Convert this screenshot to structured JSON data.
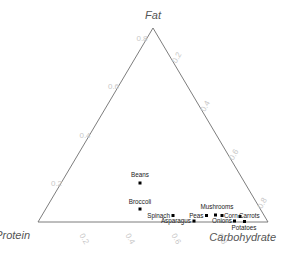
{
  "chart_data": {
    "type": "scatter",
    "subtype": "ternary",
    "title": "",
    "axes": {
      "top": {
        "name": "Fat",
        "label": "Fat"
      },
      "left": {
        "name": "Protein",
        "label": "Protein"
      },
      "right": {
        "name": "Carbohydrate",
        "label": "Carbohydrate"
      }
    },
    "ticks": {
      "left": [
        "0.2",
        "0.4",
        "0.6",
        "0.8"
      ],
      "right": [
        "0.2",
        "0.4",
        "0.6",
        "0.8"
      ],
      "bottom": [
        "0.2",
        "0.4",
        "0.6",
        "0.8"
      ]
    },
    "axis_range": [
      0,
      1
    ],
    "grid": false,
    "legend": "none",
    "points": [
      {
        "label": "Beans",
        "px": 140.0,
        "py": 183.0,
        "lx": 140.0,
        "ly": 177.0,
        "anchor": "middle"
      },
      {
        "label": "Broccoli",
        "px": 140.0,
        "py": 209.0,
        "lx": 140.0,
        "ly": 203.5,
        "anchor": "middle"
      },
      {
        "label": "Spinach",
        "px": 173.0,
        "py": 215.5,
        "lx": 170.0,
        "ly": 217.5,
        "anchor": "end"
      },
      {
        "label": "Asparagus",
        "px": 194.0,
        "py": 221.0,
        "lx": 191.0,
        "ly": 222.8,
        "anchor": "end"
      },
      {
        "label": "Peas",
        "px": 206.5,
        "py": 215.5,
        "lx": 203.5,
        "ly": 217.5,
        "anchor": "end"
      },
      {
        "label": "Mushrooms",
        "px": 215.5,
        "py": 215.0,
        "lx": 217.0,
        "ly": 208.5,
        "anchor": "middle"
      },
      {
        "label": "Corn",
        "px": 222.0,
        "py": 215.5,
        "lx": 224.0,
        "ly": 217.5,
        "anchor": "start"
      },
      {
        "label": "Onions",
        "px": 234.5,
        "py": 221.0,
        "lx": 232.0,
        "ly": 222.8,
        "anchor": "end"
      },
      {
        "label": "Carrots",
        "px": 240.0,
        "py": 216.5,
        "lx": 239.0,
        "ly": 217.5,
        "anchor": "start"
      },
      {
        "label": "Potatoes",
        "px": 244.5,
        "py": 221.5,
        "lx": 244.0,
        "ly": 229.5,
        "anchor": "middle"
      }
    ],
    "colors": {
      "axis_line": "#6e6e6e",
      "tick_text": "#c8c8c8",
      "vertex_text": "#555555",
      "marker": "#000000",
      "background": "#ffffff"
    }
  },
  "geometry": {
    "apex": {
      "x": 153,
      "y": 28
    },
    "bottom_left": {
      "x": 38,
      "y": 222
    },
    "bottom_right": {
      "x": 268,
      "y": 222
    }
  },
  "tick_positions": {
    "left": [
      {
        "v": "0.2",
        "x": 56.5,
        "y": 186.0
      },
      {
        "v": "0.4",
        "x": 85.0,
        "y": 137.5
      },
      {
        "v": "0.6",
        "x": 113.5,
        "y": 89.0
      },
      {
        "v": "0.8",
        "x": 142.0,
        "y": 40.5
      }
    ],
    "right": [
      {
        "v": "0.2",
        "x": 179.0,
        "y": 59.0
      },
      {
        "v": "0.4",
        "x": 207.5,
        "y": 107.5
      },
      {
        "v": "0.6",
        "x": 236.0,
        "y": 156.0
      },
      {
        "v": "0.8",
        "x": 264.5,
        "y": 204.5
      }
    ],
    "bottom": [
      {
        "v": "0.2",
        "x": 82.0,
        "y": 240.0
      },
      {
        "v": "0.4",
        "x": 128.0,
        "y": 240.0
      },
      {
        "v": "0.6",
        "x": 174.0,
        "y": 240.0
      },
      {
        "v": "0.8",
        "x": 220.0,
        "y": 240.0
      }
    ]
  },
  "vertex_labels": {
    "fat": {
      "text": "Fat",
      "x": 153,
      "y": 19
    },
    "protein": {
      "text": "Protein",
      "x": 30,
      "y": 239
    },
    "carbohydrate": {
      "text": "Carbohydrate",
      "x": 276,
      "y": 241
    }
  }
}
